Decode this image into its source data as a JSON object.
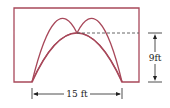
{
  "diagram": {
    "title": "",
    "colors": {
      "outline": "#a8485a",
      "dimension": "#222222",
      "dashed": "#555555"
    },
    "shape": "rectangle with parabolic arch opening",
    "labels": {
      "height": "9ft",
      "width": "15 ft"
    },
    "dimensions": {
      "arch_height_ft": 9,
      "arch_base_width_ft": 15
    }
  }
}
